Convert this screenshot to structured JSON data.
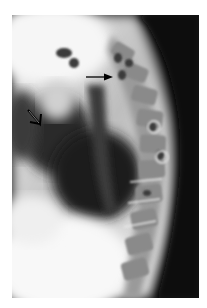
{
  "image": {
    "description": "Lateral radiograph of the thoracic spine with two arrow annotations",
    "background_color": "#ffffff",
    "film_dark_color": "#0a0a0a",
    "film_light_color": "#f4f4f4"
  },
  "annotations": [
    {
      "type": "arrow",
      "style": "thin-line-arrow",
      "direction": "right",
      "color": "#000000"
    },
    {
      "type": "arrow",
      "style": "open-arrowhead",
      "direction": "down-right",
      "color": "#000000"
    }
  ]
}
